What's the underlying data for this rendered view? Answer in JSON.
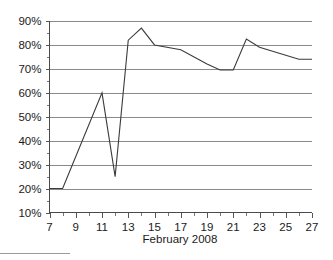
{
  "chart_data": {
    "type": "line",
    "title": "",
    "subtitle": "",
    "xlabel": "February 2008",
    "ylabel": "",
    "xlim": [
      7,
      27
    ],
    "ylim": [
      10,
      90
    ],
    "grid": true,
    "legend": false,
    "y_tick_labels": [
      "90%",
      "80%",
      "70%",
      "60%",
      "50%",
      "40%",
      "30%",
      "20%",
      "10%"
    ],
    "y_tick_values": [
      90,
      80,
      70,
      60,
      50,
      40,
      30,
      20,
      10
    ],
    "y_minor_step": 5,
    "x_tick_labels": [
      "7",
      "9",
      "11",
      "13",
      "15",
      "17",
      "19",
      "21",
      "23",
      "25",
      "27"
    ],
    "x_tick_values": [
      7,
      9,
      11,
      13,
      15,
      17,
      19,
      21,
      23,
      25,
      27
    ],
    "x_minor_step": 1,
    "x": [
      7,
      8,
      11,
      12,
      13,
      14,
      15,
      17,
      19,
      20,
      21,
      22,
      23,
      26,
      27
    ],
    "values": [
      20,
      20,
      60,
      25,
      82,
      87,
      80,
      78,
      72,
      69.5,
      69.5,
      82.5,
      79,
      74,
      74
    ],
    "series": [
      {
        "name": "value",
        "x": [
          7,
          8,
          11,
          12,
          13,
          14,
          15,
          17,
          19,
          20,
          21,
          22,
          23,
          26,
          27
        ],
        "values": [
          20,
          20,
          60,
          25,
          82,
          87,
          80,
          78,
          72,
          69.5,
          69.5,
          82.5,
          79,
          74,
          74
        ]
      }
    ],
    "colors": {
      "line": "#3b3b3b",
      "grid": "#8a8a8a",
      "axis": "#4a4a4a",
      "text": "#1a1a1a",
      "background": "#ffffff"
    }
  }
}
